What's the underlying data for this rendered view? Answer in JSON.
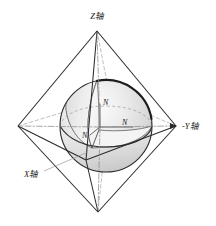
{
  "figure": {
    "title": "",
    "type": "3d-geometry-diagram",
    "background_color": "#ffffff"
  },
  "axes": {
    "z_label": "Z轴",
    "y_label": "-Y轴",
    "x_label": "X轴"
  },
  "normals": {
    "n_top": "N",
    "n_right": "N",
    "n_origin": "N"
  },
  "colors": {
    "stroke": "#2b2b2b",
    "thin_stroke": "#555555",
    "hidden_stroke": "#9a9a9a",
    "sphere_light": "#f2f2f2",
    "sphere_mid": "#d8d8d8",
    "sphere_dark": "#bdbdbd",
    "cut_face": "#ebebeb",
    "text": "#1a1a1a"
  },
  "geometry": {
    "octahedron_vertices": {
      "top": [
        97,
        31
      ],
      "bottom": [
        98,
        212
      ],
      "left": [
        18,
        126
      ],
      "right": [
        176,
        126
      ],
      "front": [
        86,
        160
      ],
      "back": [
        110,
        98
      ]
    },
    "sphere_center": [
      106,
      126
    ],
    "sphere_radius": 46
  }
}
